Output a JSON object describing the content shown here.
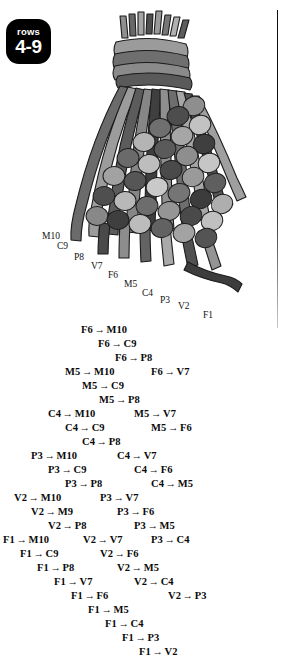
{
  "badge": {
    "word": "rows",
    "range": "4-9"
  },
  "illustration": {
    "name": "macrame-cord-bundle-diagram",
    "binding_label": "wrapped-cord-bundle",
    "bead_colors": [
      "#a8a8a8",
      "#c9c9c9",
      "#6e6e6e",
      "#4a4a4a",
      "#8d8d8d",
      "#bdbdbd",
      "#5a5a5a"
    ],
    "cord_colors": [
      "#7a7a7a",
      "#9d9d9d",
      "#5c5c5c",
      "#3f3f3f",
      "#b5b5b5"
    ]
  },
  "cord_labels": [
    {
      "text": "M10",
      "x": 42,
      "y": 231
    },
    {
      "text": "C9",
      "x": 57,
      "y": 241
    },
    {
      "text": "P8",
      "x": 74,
      "y": 252
    },
    {
      "text": "V7",
      "x": 91,
      "y": 261
    },
    {
      "text": "F6",
      "x": 108,
      "y": 270
    },
    {
      "text": "M5",
      "x": 124,
      "y": 279
    },
    {
      "text": "C4",
      "x": 142,
      "y": 288
    },
    {
      "text": "P3",
      "x": 160,
      "y": 295
    },
    {
      "text": "V2",
      "x": 178,
      "y": 301
    },
    {
      "text": "F1",
      "x": 203,
      "y": 310
    }
  ],
  "knots": [
    {
      "from": "F6",
      "to": "M10",
      "x": 81,
      "y": 324
    },
    {
      "from": "F6",
      "to": "C9",
      "x": 98,
      "y": 338
    },
    {
      "from": "F6",
      "to": "P8",
      "x": 115,
      "y": 352
    },
    {
      "from": "M5",
      "to": "M10",
      "x": 65,
      "y": 366
    },
    {
      "from": "F6",
      "to": "V7",
      "x": 151,
      "y": 366
    },
    {
      "from": "M5",
      "to": "C9",
      "x": 82,
      "y": 380
    },
    {
      "from": "M5",
      "to": "P8",
      "x": 99,
      "y": 394
    },
    {
      "from": "C4",
      "to": "M10",
      "x": 48,
      "y": 408
    },
    {
      "from": "M5",
      "to": "V7",
      "x": 134,
      "y": 408
    },
    {
      "from": "C4",
      "to": "C9",
      "x": 65,
      "y": 422
    },
    {
      "from": "M5",
      "to": "F6",
      "x": 151,
      "y": 422
    },
    {
      "from": "C4",
      "to": "P8",
      "x": 82,
      "y": 436
    },
    {
      "from": "P3",
      "to": "M10",
      "x": 31,
      "y": 450
    },
    {
      "from": "C4",
      "to": "V7",
      "x": 117,
      "y": 450
    },
    {
      "from": "P3",
      "to": "C9",
      "x": 48,
      "y": 464
    },
    {
      "from": "C4",
      "to": "F6",
      "x": 134,
      "y": 464
    },
    {
      "from": "P3",
      "to": "P8",
      "x": 65,
      "y": 478
    },
    {
      "from": "C4",
      "to": "M5",
      "x": 151,
      "y": 478
    },
    {
      "from": "V2",
      "to": "M10",
      "x": 14,
      "y": 492
    },
    {
      "from": "P3",
      "to": "V7",
      "x": 100,
      "y": 492
    },
    {
      "from": "V2",
      "to": "M9",
      "x": 31,
      "y": 506
    },
    {
      "from": "P3",
      "to": "F6",
      "x": 117,
      "y": 506
    },
    {
      "from": "V2",
      "to": "P8",
      "x": 48,
      "y": 520
    },
    {
      "from": "P3",
      "to": "M5",
      "x": 134,
      "y": 520
    },
    {
      "from": "F1",
      "to": "M10",
      "x": 3,
      "y": 534
    },
    {
      "from": "V2",
      "to": "V7",
      "x": 83,
      "y": 534
    },
    {
      "from": "P3",
      "to": "C4",
      "x": 151,
      "y": 534
    },
    {
      "from": "F1",
      "to": "C9",
      "x": 20,
      "y": 548
    },
    {
      "from": "V2",
      "to": "F6",
      "x": 100,
      "y": 548
    },
    {
      "from": "F1",
      "to": "P8",
      "x": 37,
      "y": 562
    },
    {
      "from": "V2",
      "to": "M5",
      "x": 117,
      "y": 562
    },
    {
      "from": "F1",
      "to": "V7",
      "x": 54,
      "y": 576
    },
    {
      "from": "V2",
      "to": "C4",
      "x": 134,
      "y": 576
    },
    {
      "from": "F1",
      "to": "F6",
      "x": 71,
      "y": 590
    },
    {
      "from": "V2",
      "to": "P3",
      "x": 168,
      "y": 590
    },
    {
      "from": "F1",
      "to": "M5",
      "x": 88,
      "y": 604
    },
    {
      "from": "F1",
      "to": "C4",
      "x": 105,
      "y": 618
    },
    {
      "from": "F1",
      "to": "P3",
      "x": 122,
      "y": 632
    },
    {
      "from": "F1",
      "to": "V2",
      "x": 139,
      "y": 646
    }
  ],
  "arrow_glyph": "→"
}
